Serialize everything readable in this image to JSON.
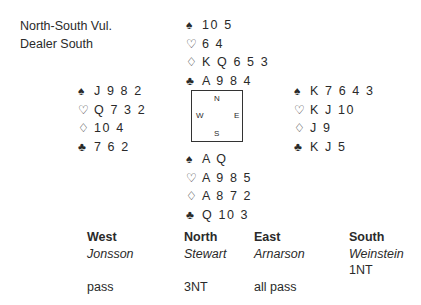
{
  "deal_info": {
    "vulnerability": "North-South Vul.",
    "dealer": "Dealer South"
  },
  "suit_symbols": {
    "spades": "♠",
    "hearts": "♡",
    "diamonds": "♢",
    "clubs": "♣"
  },
  "hands": {
    "north": {
      "spades": "10 5",
      "hearts": "6 4",
      "diamonds": "K Q 6 5 3",
      "clubs": "A 9 8 4"
    },
    "west": {
      "spades": "J 9 8 2",
      "hearts": "Q 7 3 2",
      "diamonds": "10 4",
      "clubs": "7 6 2"
    },
    "east": {
      "spades": "K 7 6 4 3",
      "hearts": "K J 10",
      "diamonds": "J 9",
      "clubs": "K J 5"
    },
    "south": {
      "spades": "A Q",
      "hearts": "A 9 8 5",
      "diamonds": "A 8 7 2",
      "clubs": "Q 10 3"
    }
  },
  "compass": {
    "n": "N",
    "w": "W",
    "e": "E",
    "s": "S"
  },
  "auction": {
    "columns": [
      {
        "seat": "West",
        "player": "Jonsson",
        "calls": [
          "",
          "pass"
        ]
      },
      {
        "seat": "North",
        "player": "Stewart",
        "calls": [
          "",
          "3NT"
        ]
      },
      {
        "seat": "East",
        "player": "Arnarson",
        "calls": [
          "",
          "all pass"
        ]
      },
      {
        "seat": "South",
        "player": "Weinstein",
        "calls": [
          "1NT",
          ""
        ]
      }
    ]
  }
}
